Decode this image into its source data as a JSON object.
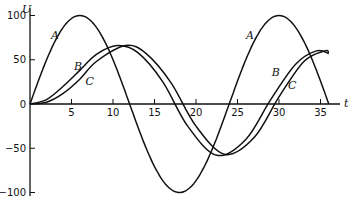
{
  "chart_data": {
    "type": "line",
    "title": "",
    "xlabel": "t",
    "ylabel": "U",
    "xlim": [
      0,
      37
    ],
    "ylim": [
      -105,
      105
    ],
    "grid": false,
    "legend": "inline curve labels",
    "x_ticks": [
      5,
      10,
      15,
      20,
      25,
      30,
      35
    ],
    "x_tick_labels": [
      "5",
      "10",
      "15",
      "20",
      "25",
      "30",
      "35"
    ],
    "y_ticks": [
      100,
      50,
      0,
      -50,
      -100
    ],
    "y_tick_labels": [
      "100",
      "50",
      "0",
      "-50",
      "-100"
    ],
    "series": [
      {
        "name": "A",
        "x": [
          0,
          3,
          6,
          9,
          12,
          15,
          18,
          21,
          24,
          27,
          30,
          33,
          36
        ],
        "values": [
          0,
          71,
          100,
          71,
          0,
          -71,
          -100,
          -71,
          0,
          71,
          100,
          71,
          0
        ]
      },
      {
        "name": "B",
        "x": [
          0,
          2,
          4,
          6,
          8,
          10.5,
          13,
          16,
          19,
          22.5,
          26,
          29,
          32,
          34.5,
          36
        ],
        "values": [
          0,
          5,
          20,
          38,
          56,
          66,
          58,
          25,
          -25,
          -58,
          -40,
          5,
          45,
          60,
          57
        ]
      },
      {
        "name": "C",
        "x": [
          0,
          2,
          4,
          6,
          8,
          11.5,
          14,
          17,
          20,
          23.5,
          27,
          30,
          33,
          35.5,
          36
        ],
        "values": [
          0,
          2,
          12,
          28,
          48,
          66,
          57,
          24,
          -25,
          -57,
          -38,
          8,
          48,
          60,
          58
        ]
      }
    ],
    "labels": [
      {
        "text": "A",
        "x": 3.0,
        "y": 73
      },
      {
        "text": "B",
        "x": 5.8,
        "y": 38
      },
      {
        "text": "C",
        "x": 7.2,
        "y": 22
      },
      {
        "text": "A",
        "x": 26.5,
        "y": 73
      },
      {
        "text": "B",
        "x": 29.6,
        "y": 32
      },
      {
        "text": "C",
        "x": 31.6,
        "y": 17
      }
    ]
  }
}
